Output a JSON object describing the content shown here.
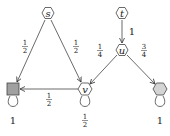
{
  "diagram": {
    "type": "markov-chain",
    "nodes": [
      {
        "id": "s",
        "label": "s",
        "shape": "hexagon",
        "fill": "#ffffff",
        "x": 48,
        "y": 13
      },
      {
        "id": "t",
        "label": "t",
        "shape": "hexagon",
        "fill": "#ffffff",
        "x": 122,
        "y": 13
      },
      {
        "id": "u",
        "label": "u",
        "shape": "hexagon",
        "fill": "#ffffff",
        "x": 122,
        "y": 50
      },
      {
        "id": "sq",
        "label": "",
        "shape": "square",
        "fill": "#a0a0a0",
        "x": 13,
        "y": 89
      },
      {
        "id": "v",
        "label": "v",
        "shape": "hexagon",
        "fill": "#ffffff",
        "x": 85,
        "y": 89
      },
      {
        "id": "r",
        "label": "",
        "shape": "hexagon",
        "fill": "#d4d4d4",
        "x": 160,
        "y": 89
      }
    ],
    "edges": [
      {
        "from": "s",
        "to": "sq",
        "label_num": "1",
        "label_den": "2"
      },
      {
        "from": "s",
        "to": "v",
        "label_num": "1",
        "label_den": "2"
      },
      {
        "from": "t",
        "to": "u",
        "label": "1"
      },
      {
        "from": "u",
        "to": "v",
        "label_num": "1",
        "label_den": "4"
      },
      {
        "from": "u",
        "to": "r",
        "label_num": "3",
        "label_den": "4"
      },
      {
        "from": "v",
        "to": "sq",
        "label_num": "1",
        "label_den": "2"
      }
    ],
    "loops": [
      {
        "node": "sq",
        "label": "1"
      },
      {
        "node": "v",
        "label_num": "1",
        "label_den": "2"
      },
      {
        "node": "r",
        "label": "1"
      }
    ]
  }
}
